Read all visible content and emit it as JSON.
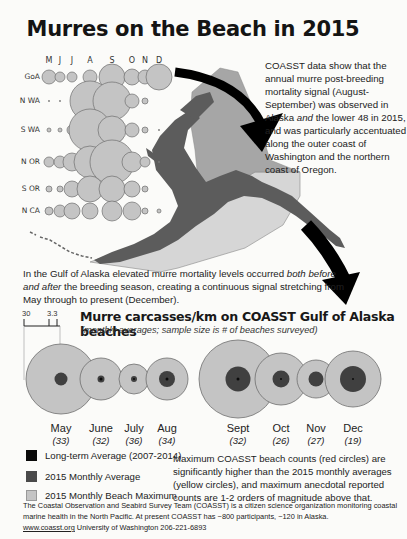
{
  "title": "Murres on the Beach in 2015",
  "regional_grid": {
    "months": [
      "M",
      "J",
      "J",
      "A",
      "S",
      "O",
      "N",
      "D"
    ],
    "rows": [
      {
        "label": "GoA",
        "sizes": [
          7,
          5,
          5,
          7,
          13,
          8,
          7,
          13
        ]
      },
      {
        "label": "N WA",
        "sizes": [
          1,
          1,
          1,
          20,
          19,
          7,
          3,
          0
        ]
      },
      {
        "label": "S WA",
        "sizes": [
          2,
          2,
          5,
          21,
          14,
          7,
          3,
          1
        ]
      },
      {
        "label": "N OR",
        "sizes": [
          5,
          6,
          9,
          16,
          22,
          10,
          5,
          1
        ]
      },
      {
        "label": "S OR",
        "sizes": [
          3,
          3,
          8,
          13,
          13,
          8,
          3,
          0
        ]
      },
      {
        "label": "N CA",
        "sizes": [
          4,
          6,
          8,
          8,
          10,
          9,
          3,
          2
        ]
      }
    ]
  },
  "intro_text": {
    "part1": "COASST data show that the annual murre post-breeding mortality signal (August-September) was observed in Alaska ",
    "emph": "and",
    "part2": " the lower 48 in 2015, and was particularly accentuated along the outer coast of Washington and the northern coast of Oregon."
  },
  "gulf_text": {
    "part1": "In the Gulf of Alaska elevated murre mortality levels occurred ",
    "emph": "both before and after",
    "part2": " the breeding season, creating a continuous signal stretching from May through to present (December)."
  },
  "chart_data": {
    "type": "bubble",
    "title": "Murre carcasses/km on COASST Gulf of Alaska beaches",
    "subtitle": "(monthly averages; sample size is # of beaches surveyed)",
    "scale_labels": [
      "30",
      "3.3"
    ],
    "categories": [
      "May",
      "June",
      "July",
      "Aug",
      "Sept",
      "Oct",
      "Nov",
      "Dec"
    ],
    "sample_sizes": [
      "(33)",
      "(32)",
      "(36)",
      "(34)",
      "(32)",
      "(26)",
      "(27)",
      "(19)"
    ],
    "series": [
      {
        "name": "2015 Monthly Beach Maximum",
        "radius_px": [
          35,
          21,
          15,
          21,
          39,
          26,
          19,
          28
        ]
      },
      {
        "name": "2015 Monthly Average",
        "radius_px": [
          6.5,
          3.5,
          3,
          8,
          12.5,
          8.5,
          7.5,
          13
        ]
      },
      {
        "name": "Long-term Average (2007-2014)",
        "radius_px": [
          0,
          1.5,
          1,
          1.5,
          1.5,
          1,
          0,
          1
        ]
      }
    ],
    "centers_x": [
      61,
      101,
      134,
      167,
      238,
      281,
      316,
      353
    ],
    "center_y": 379
  },
  "legend": [
    {
      "label": "Long-term Average (2007-2014)",
      "color": "#0a0a0a"
    },
    {
      "label": "2015 Monthly Average",
      "color": "#4a4a4a"
    },
    {
      "label": "2015 Monthly Beach Maximum",
      "color": "#c4c4c4"
    }
  ],
  "max_note": "Maximum COASST beach counts (red circles) are significantly higher than the 2015 monthly averages (yellow circles), and maximum anecdotal reported counts are 1-2 orders of magnitude above that.",
  "footer": {
    "line1": "The Coastal Observation and Seabird Survey Team (COASST) is a citizen science organization monitoring coastal marine health in the North Pacific. At present COASST has ~800 participants, ~120 in Alaska.",
    "link": "www.coasst.org",
    "line2": " University of Washington 206-221-6893"
  },
  "colors": {
    "bubble_fill": "#c4c4c4",
    "bubble_stroke": "#6e6e6e",
    "avg_fill": "#404040",
    "longterm_fill": "#0a0a0a",
    "land": "#5a5a5a",
    "region_shade_dark": "#9e9e9e",
    "region_shade_light": "#d4d4d4"
  }
}
